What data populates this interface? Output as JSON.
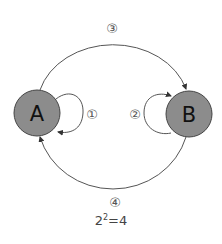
{
  "diagram": {
    "nodes": [
      {
        "id": "A",
        "label": "A",
        "fill": "#8c8c8c"
      },
      {
        "id": "B",
        "label": "B",
        "fill": "#8c8c8c"
      }
    ],
    "edges": [
      {
        "label": "①",
        "from": "A",
        "to": "A",
        "type": "self-loop"
      },
      {
        "label": "②",
        "from": "B",
        "to": "B",
        "type": "self-loop"
      },
      {
        "label": "③",
        "from": "A",
        "to": "B",
        "type": "arc-top"
      },
      {
        "label": "④",
        "from": "B",
        "to": "A",
        "type": "arc-bottom"
      }
    ],
    "equation": {
      "base": "2",
      "exp": "2",
      "rest": "=4"
    }
  }
}
